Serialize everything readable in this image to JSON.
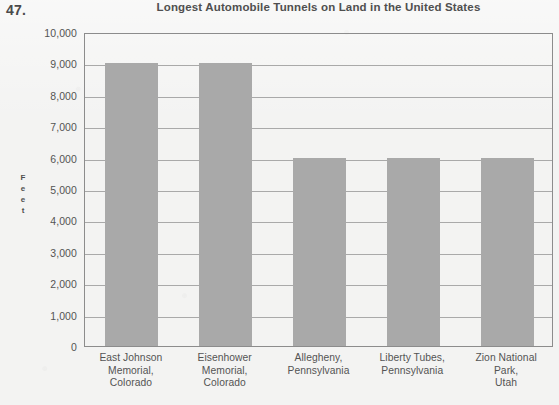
{
  "question_number": "47.",
  "chart_data": {
    "type": "bar",
    "title": "Longest Automobile Tunnels on Land in the United States",
    "xlabel": "",
    "ylabel": "Feet",
    "ylabel_letters": [
      "F",
      "e",
      "e",
      "t"
    ],
    "categories": [
      "East Johnson Memorial, Colorado",
      "Eisenhower Memorial, Colorado",
      "Allegheny, Pennsylvania",
      "Liberty Tubes, Pennsylvania",
      "Zion National Park, Utah"
    ],
    "category_lines": [
      [
        "East Johnson",
        "Memorial,",
        "Colorado"
      ],
      [
        "Eisenhower",
        "Memorial,",
        "Colorado"
      ],
      [
        "Allegheny,",
        "Pennsylvania"
      ],
      [
        "Liberty Tubes,",
        "Pennsylvania"
      ],
      [
        "Zion National",
        "Park,",
        "Utah"
      ]
    ],
    "values": [
      9000,
      9000,
      6000,
      6000,
      6000
    ],
    "ylim": [
      0,
      10000
    ],
    "ytick_step": 1000,
    "ytick_labels": [
      "10,000",
      "9,000",
      "8,000",
      "7,000",
      "6,000",
      "5,000",
      "4,000",
      "3,000",
      "2,000",
      "1,000",
      "0"
    ],
    "grid": true,
    "legend": "none",
    "bar_color": "#a9a9a9",
    "axis_color": "#8c8c8c",
    "grid_color": "#a9a9a9",
    "text_color": "#545454",
    "background_color": "#f3f3f2"
  }
}
